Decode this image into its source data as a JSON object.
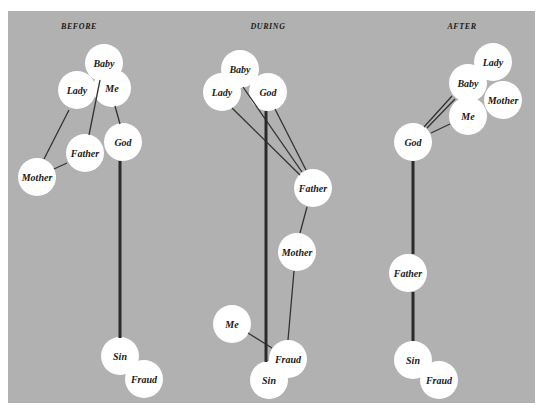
{
  "colors": {
    "panel": "#b1b1b1",
    "node": "#ffffff",
    "edge": "#333333",
    "text": "#1a1a1a"
  },
  "node_radius": 19,
  "stages": [
    {
      "id": "before",
      "title": "BEFORE",
      "title_pos": [
        79,
        29
      ],
      "nodes": [
        {
          "label": "Lady",
          "x": 77,
          "y": 90
        },
        {
          "label": "Me",
          "x": 112,
          "y": 88
        },
        {
          "label": "Baby",
          "x": 104,
          "y": 63
        },
        {
          "label": "God",
          "x": 123,
          "y": 142
        },
        {
          "label": "Father",
          "x": 85,
          "y": 153
        },
        {
          "label": "Mother",
          "x": 37,
          "y": 177
        },
        {
          "label": "Sin",
          "x": 120,
          "y": 356
        },
        {
          "label": "Fraud",
          "x": 144,
          "y": 379
        }
      ],
      "edges": [
        {
          "from": [
            69,
            110
          ],
          "to": [
            44,
            159
          ],
          "strong": false
        },
        {
          "from": [
            100,
            80
          ],
          "to": [
            89,
            135
          ],
          "strong": false
        },
        {
          "from": [
            115,
            106
          ],
          "to": [
            120,
            124
          ],
          "strong": false
        },
        {
          "from": [
            67,
            163
          ],
          "to": [
            54,
            169
          ],
          "strong": false
        },
        {
          "from": [
            120,
            161
          ],
          "to": [
            120,
            338
          ],
          "strong": true
        }
      ]
    },
    {
      "id": "during",
      "title": "DURING",
      "title_pos": [
        268,
        29
      ],
      "nodes": [
        {
          "label": "Lady",
          "x": 222,
          "y": 92
        },
        {
          "label": "God",
          "x": 268,
          "y": 92
        },
        {
          "label": "Baby",
          "x": 240,
          "y": 69
        },
        {
          "label": "Father",
          "x": 313,
          "y": 188
        },
        {
          "label": "Mother",
          "x": 297,
          "y": 252
        },
        {
          "label": "Me",
          "x": 232,
          "y": 324
        },
        {
          "label": "Sin",
          "x": 269,
          "y": 380
        },
        {
          "label": "Fraud",
          "x": 288,
          "y": 359
        }
      ],
      "edges": [
        {
          "from": [
            232,
            108
          ],
          "to": [
            300,
            175
          ],
          "strong": false
        },
        {
          "from": [
            243,
            87
          ],
          "to": [
            302,
            172
          ],
          "strong": false
        },
        {
          "from": [
            275,
            109
          ],
          "to": [
            306,
            170
          ],
          "strong": false
        },
        {
          "from": [
            307,
            207
          ],
          "to": [
            300,
            233
          ],
          "strong": false
        },
        {
          "from": [
            294,
            271
          ],
          "to": [
            288,
            340
          ],
          "strong": false
        },
        {
          "from": [
            248,
            333
          ],
          "to": [
            272,
            348
          ],
          "strong": false
        },
        {
          "from": [
            266,
            111
          ],
          "to": [
            266,
            362
          ],
          "strong": true
        }
      ]
    },
    {
      "id": "after",
      "title": "AFTER",
      "title_pos": [
        462,
        29
      ],
      "nodes": [
        {
          "label": "Lady",
          "x": 493,
          "y": 62
        },
        {
          "label": "Mother",
          "x": 503,
          "y": 100
        },
        {
          "label": "Me",
          "x": 468,
          "y": 116
        },
        {
          "label": "Baby",
          "x": 468,
          "y": 83
        },
        {
          "label": "God",
          "x": 413,
          "y": 142
        },
        {
          "label": "Father",
          "x": 408,
          "y": 273
        },
        {
          "label": "Sin",
          "x": 413,
          "y": 360
        },
        {
          "label": "Fraud",
          "x": 439,
          "y": 380
        }
      ],
      "edges": [
        {
          "from": [
            424,
            127
          ],
          "to": [
            452,
            96
          ],
          "strong": false
        },
        {
          "from": [
            427,
            128
          ],
          "to": [
            455,
            99
          ],
          "strong": false
        },
        {
          "from": [
            431,
            133
          ],
          "to": [
            450,
            124
          ],
          "strong": false
        },
        {
          "from": [
            413,
            161
          ],
          "to": [
            413,
            254
          ],
          "strong": true
        },
        {
          "from": [
            413,
            292
          ],
          "to": [
            413,
            341
          ],
          "strong": true
        }
      ]
    }
  ]
}
